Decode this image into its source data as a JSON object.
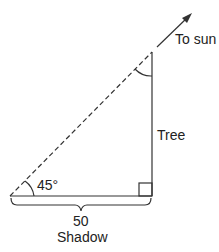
{
  "diagram": {
    "labels": {
      "sun": "To sun",
      "tree": "Tree",
      "angle": "45°",
      "length": "50",
      "shadow": "Shadow"
    },
    "colors": {
      "stroke": "#333333",
      "text": "#222222"
    }
  }
}
